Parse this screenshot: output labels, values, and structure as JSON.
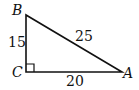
{
  "diagram": {
    "type": "right-triangle",
    "vertices": {
      "A": {
        "label": "A"
      },
      "B": {
        "label": "B"
      },
      "C": {
        "label": "C",
        "right_angle": true
      }
    },
    "sides": {
      "BC": {
        "length_label": "15"
      },
      "AB": {
        "length_label": "25"
      },
      "CA": {
        "length_label": "20"
      }
    },
    "stroke_color": "#111111",
    "background": "#ffffff"
  }
}
